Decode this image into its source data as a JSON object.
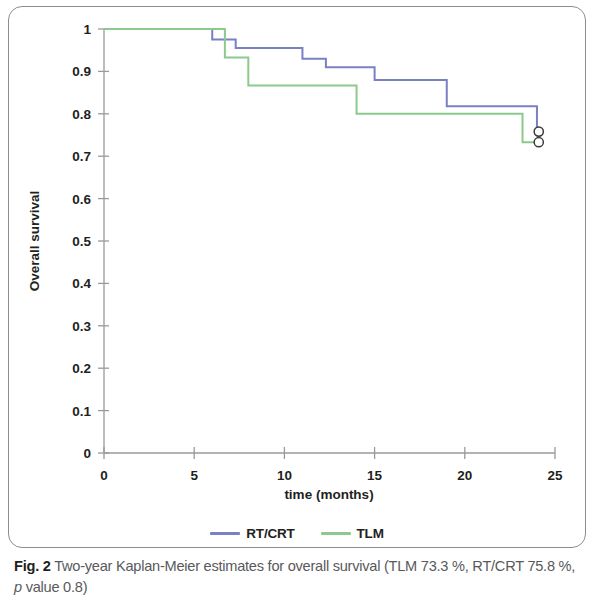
{
  "figure": {
    "caption_label": "Fig. 2",
    "caption_text_part1": " Two-year Kaplan-Meier estimates for overall survival (TLM 73.3 %, RT/CRT 75.8 %, ",
    "caption_italic": "p",
    "caption_text_part2": " value 0.8)"
  },
  "legend": {
    "items": [
      {
        "label": "RT/CRT",
        "color": "#7b7fc4"
      },
      {
        "label": "TLM",
        "color": "#8cc98c"
      }
    ]
  },
  "chart_data": {
    "type": "line",
    "subtype": "kaplan-meier-step",
    "title": "",
    "xlabel": "time (months)",
    "ylabel": "Overall survival",
    "xlim": [
      0,
      25
    ],
    "ylim": [
      0,
      1
    ],
    "xticks": [
      0,
      5,
      10,
      15,
      20,
      25
    ],
    "xtick_labels": [
      "0",
      "5",
      "10",
      "15",
      "20",
      "25"
    ],
    "yticks": [
      0,
      0.1,
      0.2,
      0.3,
      0.4,
      0.5,
      0.6,
      0.7,
      0.8,
      0.9,
      1
    ],
    "ytick_labels": [
      "0",
      "0.1",
      "0.2",
      "0.3",
      "0.4",
      "0.5",
      "0.6",
      "0.7",
      "0.8",
      "0.9",
      "1"
    ],
    "grid": false,
    "legend_position": "bottom",
    "series": [
      {
        "name": "RT/CRT",
        "color": "#7b7fc4",
        "two_year_survival_pct": 75.8,
        "steps": [
          {
            "time": 0,
            "survival": 1.0
          },
          {
            "time": 6.0,
            "survival": 0.975
          },
          {
            "time": 7.3,
            "survival": 0.955
          },
          {
            "time": 11.0,
            "survival": 0.93
          },
          {
            "time": 12.3,
            "survival": 0.91
          },
          {
            "time": 15.0,
            "survival": 0.88
          },
          {
            "time": 19.0,
            "survival": 0.818
          },
          {
            "time": 24.0,
            "survival": 0.758
          }
        ],
        "censored": [
          {
            "time": 24.1,
            "survival": 0.758
          }
        ]
      },
      {
        "name": "TLM",
        "color": "#8cc98c",
        "two_year_survival_pct": 73.3,
        "steps": [
          {
            "time": 0,
            "survival": 1.0
          },
          {
            "time": 6.7,
            "survival": 0.933
          },
          {
            "time": 8.0,
            "survival": 0.867
          },
          {
            "time": 14.0,
            "survival": 0.8
          },
          {
            "time": 23.2,
            "survival": 0.733
          }
        ],
        "censored": [
          {
            "time": 24.1,
            "survival": 0.733
          }
        ]
      }
    ],
    "annotations": [
      {
        "kind": "censor-mark",
        "marker": "open-circle",
        "time": 24.1,
        "survival": 0.758,
        "series": "RT/CRT"
      },
      {
        "kind": "censor-mark",
        "marker": "open-circle",
        "time": 24.1,
        "survival": 0.733,
        "series": "TLM"
      }
    ]
  }
}
